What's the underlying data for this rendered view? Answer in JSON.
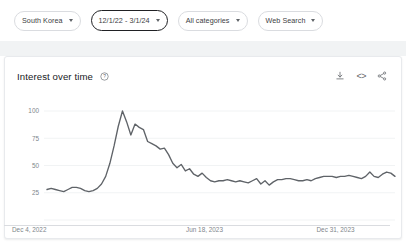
{
  "filter_bar": {
    "chips": [
      {
        "label": "South Korea",
        "active": false,
        "name": "geo-filter-chip"
      },
      {
        "label": "12/1/22 - 3/1/24",
        "active": true,
        "name": "date-range-filter-chip"
      },
      {
        "label": "All categories",
        "active": false,
        "name": "category-filter-chip"
      },
      {
        "label": "Web Search",
        "active": false,
        "name": "search-type-filter-chip"
      }
    ]
  },
  "card": {
    "title": "Interest over time",
    "help_icon": "help-circle-icon",
    "actions": [
      {
        "name": "download-csv-button",
        "icon": "download-icon"
      },
      {
        "name": "embed-chart-button",
        "icon": "embed-code-icon",
        "glyph": "<>"
      },
      {
        "name": "share-chart-button",
        "icon": "share-icon"
      }
    ]
  },
  "colors": {
    "line": "#5f6368",
    "grid": "#f1f3f4",
    "chip_border": "#dadce0",
    "chip_active_border": "#202124",
    "text_primary": "#202124",
    "text_secondary": "#80868b",
    "band": "#f1f3f4"
  },
  "chart_data": {
    "type": "line",
    "title": "Interest over time",
    "xlabel": "",
    "ylabel": "",
    "ylim": [
      0,
      100
    ],
    "yticks": [
      100,
      75,
      50,
      25
    ],
    "grid": true,
    "legend": "none",
    "xtick_labels": [
      "Dec 4, 2022",
      "Jun 18, 2023",
      "Dec 31, 2023"
    ],
    "xtick_positions": [
      0,
      0.5,
      0.875
    ],
    "series": [
      {
        "name": "Search interest",
        "values": [
          28,
          29,
          28,
          27,
          26,
          28,
          30,
          30,
          29,
          27,
          26,
          27,
          29,
          33,
          40,
          52,
          68,
          86,
          100,
          90,
          78,
          88,
          85,
          83,
          72,
          70,
          68,
          65,
          66,
          60,
          52,
          48,
          51,
          45,
          47,
          42,
          40,
          43,
          39,
          36,
          35,
          36,
          36,
          37,
          36,
          35,
          36,
          35,
          34,
          36,
          38,
          33,
          36,
          32,
          35,
          37,
          37,
          38,
          38,
          37,
          36,
          36,
          37,
          36,
          38,
          39,
          40,
          40,
          40,
          39,
          40,
          40,
          41,
          40,
          39,
          38,
          40,
          44,
          40,
          39,
          42,
          44,
          43,
          40
        ]
      }
    ]
  }
}
